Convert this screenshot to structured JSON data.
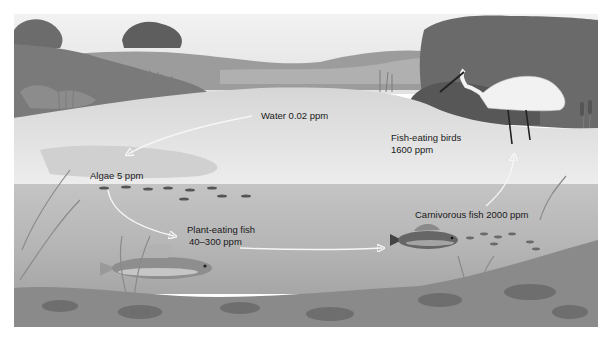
{
  "diagram": {
    "title": "",
    "type": "food-chain biomagnification illustration",
    "palette": {
      "sky": "#ececec",
      "far_hills": "#a8a8a8",
      "dark_foliage": "#6e6e6e",
      "surface_water": "#e3e3e3",
      "underwater": "#b9b9b9",
      "lake_bed": "#8a8a8a",
      "arrow": "#f4f4f4",
      "text": "#1a1a1a"
    },
    "labels": {
      "water": "Water 0.02 ppm",
      "algae": "Algae 5 ppm",
      "plant_fish_name": "Plant-eating fish",
      "plant_fish_value": "40–300 ppm",
      "carnivorous_fish": "Carnivorous fish 2000 ppm",
      "birds_name": "Fish-eating birds",
      "birds_value": "1600 ppm"
    },
    "food_chain": [
      {
        "organism": "Water",
        "concentration_ppm": "0.02"
      },
      {
        "organism": "Algae",
        "concentration_ppm": "5"
      },
      {
        "organism": "Plant-eating fish",
        "concentration_ppm": "40–300"
      },
      {
        "organism": "Carnivorous fish",
        "concentration_ppm": "2000"
      },
      {
        "organism": "Fish-eating birds",
        "concentration_ppm": "1600"
      }
    ],
    "arrows": [
      {
        "from": "Water",
        "to": "Algae"
      },
      {
        "from": "Algae",
        "to": "Plant-eating fish"
      },
      {
        "from": "Plant-eating fish",
        "to": "Carnivorous fish"
      },
      {
        "from": "Carnivorous fish",
        "to": "Fish-eating birds"
      }
    ]
  }
}
